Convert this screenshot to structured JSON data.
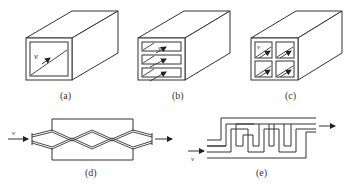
{
  "figure": {
    "panels": [
      {
        "id": "a",
        "label": "(a)",
        "description": "Single rectangular channel with flow velocity v",
        "velocity_label": "v",
        "channels": 1
      },
      {
        "id": "b",
        "label": "(b)",
        "description": "Channel divided into three stacked parallel sub-channels",
        "velocity_label": "v",
        "channels": 3
      },
      {
        "id": "c",
        "label": "(c)",
        "description": "Channel divided into 2x2 grid of sub-channels",
        "velocity_label": "v",
        "channels": 4
      },
      {
        "id": "d",
        "label": "(d)",
        "description": "Crossing zigzag (corrugated) channels in rectangular housing",
        "velocity_label": "v"
      },
      {
        "id": "e",
        "label": "(e)",
        "description": "Serpentine flow channel",
        "velocity_label": "v"
      }
    ]
  },
  "colors": {
    "line": "#333333",
    "background": "#ffffff"
  }
}
